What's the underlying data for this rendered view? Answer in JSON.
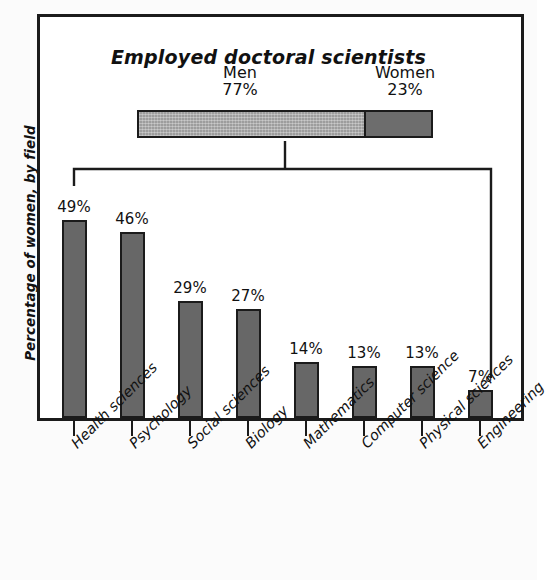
{
  "figure": {
    "chart_title": "Employed doctoral scientists",
    "y_axis_label": "Percentage of women, by field"
  },
  "summary_bar": {
    "men": {
      "label": "Men",
      "value": "77%",
      "percent": 77,
      "color": "#9d9d9d"
    },
    "women": {
      "label": "Women",
      "value": "23%",
      "percent": 23,
      "color": "#6d6d6d"
    }
  },
  "chart_data": {
    "type": "bar",
    "title": "Employed doctoral scientists",
    "xlabel": "",
    "ylabel": "Percentage of women, by field",
    "ylim": [
      0,
      55
    ],
    "grid": false,
    "legend": null,
    "categories": [
      "Health sciences",
      "Psychology",
      "Social sciences",
      "Biology",
      "Mathematics",
      "Computer science",
      "Physical sciences",
      "Engineering"
    ],
    "values": [
      49,
      46,
      29,
      27,
      14,
      13,
      13,
      7
    ],
    "data_labels": [
      "49%",
      "46%",
      "29%",
      "27%",
      "14%",
      "13%",
      "13%",
      "7%"
    ],
    "bar_color": "#676767",
    "bar_edge_color": "#1b1b1b",
    "annotations": [
      {
        "text": "Men 77%",
        "kind": "stacked-segment"
      },
      {
        "text": "Women 23%",
        "kind": "stacked-segment"
      }
    ]
  }
}
